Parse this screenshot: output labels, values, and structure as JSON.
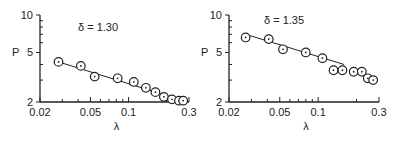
{
  "chart_data": [
    {
      "type": "scatter",
      "title": "δ = 1.30",
      "xlabel": "λ",
      "ylabel": "P",
      "xscale": "log",
      "yscale": "log",
      "xlim": [
        0.02,
        0.3
      ],
      "ylim": [
        2,
        10
      ],
      "xticks": [
        "0.02",
        "0.05",
        "0.1",
        "0.3"
      ],
      "yticks": [
        "2",
        "5",
        "10"
      ],
      "grid": false,
      "series": [
        {
          "name": "data",
          "marker": "circle-dot",
          "x": [
            0.028,
            0.042,
            0.054,
            0.082,
            0.11,
            0.137,
            0.163,
            0.19,
            0.22,
            0.25,
            0.27
          ],
          "y": [
            4.2,
            3.9,
            3.2,
            3.1,
            2.9,
            2.6,
            2.4,
            2.2,
            2.1,
            2.05,
            2.05
          ]
        },
        {
          "name": "fit",
          "style": "line",
          "x": [
            0.028,
            0.27
          ],
          "y": [
            4.2,
            2.05
          ]
        }
      ]
    },
    {
      "type": "scatter",
      "title": "δ = 1.35",
      "xlabel": "λ",
      "ylabel": "P",
      "xscale": "log",
      "yscale": "log",
      "xlim": [
        0.02,
        0.3
      ],
      "ylim": [
        2,
        10
      ],
      "xticks": [
        "0.02",
        "0.05",
        "0.1",
        "0.3"
      ],
      "yticks": [
        "2",
        "5",
        "10"
      ],
      "grid": false,
      "series": [
        {
          "name": "data",
          "marker": "circle-dot",
          "x": [
            0.027,
            0.041,
            0.053,
            0.08,
            0.108,
            0.132,
            0.155,
            0.19,
            0.22,
            0.245,
            0.27
          ],
          "y": [
            6.6,
            6.4,
            5.3,
            5.0,
            4.5,
            3.6,
            3.6,
            3.5,
            3.5,
            3.1,
            3.0
          ]
        },
        {
          "name": "fit",
          "style": "line",
          "x": [
            0.027,
            0.16
          ],
          "y": [
            7.0,
            4.0
          ]
        }
      ]
    }
  ]
}
